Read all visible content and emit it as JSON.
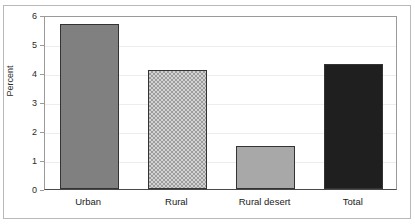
{
  "chart_data": {
    "type": "bar",
    "title": "",
    "xlabel": "",
    "ylabel": "Percent",
    "categories": [
      "Urban",
      "Rural",
      "Rural desert",
      "Total"
    ],
    "values": [
      5.7,
      4.1,
      1.5,
      4.3
    ],
    "ylim": [
      0,
      6
    ],
    "yticks": [
      "0",
      "1",
      "2",
      "3",
      "4",
      "5",
      "6"
    ],
    "grid": true,
    "legend": "none",
    "series": [
      {
        "name": "Percent",
        "values": [
          5.7,
          4.1,
          1.5,
          4.3
        ]
      }
    ],
    "bar_styles": [
      {
        "category": "Urban",
        "fill": "solid-medium-gray",
        "color": "#808080"
      },
      {
        "category": "Rural",
        "fill": "checkered-pattern",
        "color": "#d2d2d2"
      },
      {
        "category": "Rural desert",
        "fill": "solid-light-gray",
        "color": "#a8a8a8"
      },
      {
        "category": "Total",
        "fill": "solid-near-black",
        "color": "#1f1f1f"
      }
    ],
    "axis_color": "#4a4a4a",
    "gridline_color": "#ededed",
    "frame_color": "#b9b9b9",
    "background": "#ffffff"
  }
}
